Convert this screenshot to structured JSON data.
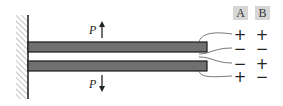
{
  "diagram": {
    "colors": {
      "beam_fill": "#707070",
      "beam_stroke": "#1a1a1a",
      "wall_hatch": "#9a9a9a",
      "header_bg": "#d6d6d6",
      "wire": "#555555"
    },
    "forces": {
      "top": {
        "label": "P",
        "direction": "up"
      },
      "bottom": {
        "label": "P",
        "direction": "down"
      }
    },
    "columns": [
      {
        "header": "A",
        "signs": [
          "+",
          "−",
          "−",
          "+"
        ]
      },
      {
        "header": "B",
        "signs": [
          "+",
          "−",
          "+",
          "−"
        ]
      }
    ]
  }
}
